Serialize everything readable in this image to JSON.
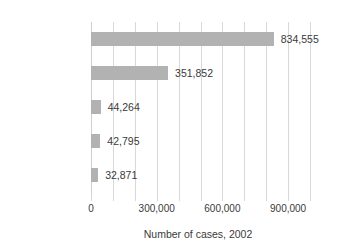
{
  "chart_data": {
    "type": "bar",
    "orientation": "horizontal",
    "title": "",
    "xlabel": "Number of cases, 2002",
    "ylabel": "",
    "categories": [
      "Chlamydia",
      "Gonorrhea",
      "Salmonellosis*",
      "AIDS",
      "Syphilis"
    ],
    "values": [
      834555,
      351852,
      44264,
      42795,
      32871
    ],
    "value_labels": [
      "834,555",
      "351,852",
      "44,264",
      "42,795",
      "32,871"
    ],
    "xlim": [
      0,
      1000000
    ],
    "xticks": [
      0,
      100000,
      200000,
      300000,
      400000,
      500000,
      600000,
      700000,
      800000,
      900000,
      1000000
    ],
    "xtick_labels_shown": [
      {
        "value": 0,
        "label": "0"
      },
      {
        "value": 300000,
        "label": "300,000"
      },
      {
        "value": 600000,
        "label": "600,000"
      },
      {
        "value": 900000,
        "label": "900,000"
      }
    ],
    "grid": true,
    "grid_axis": "x",
    "legend": false,
    "bar_color": "#b2b2b2",
    "grid_color": "#d8d8d8",
    "text_color": "#3a3a3a",
    "background": "#ffffff"
  }
}
